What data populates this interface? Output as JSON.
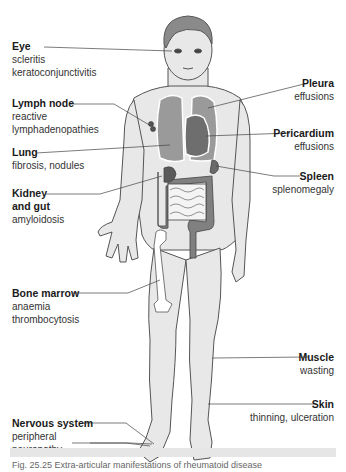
{
  "colors": {
    "skin": "#e8e8e8",
    "outline": "#555555",
    "hair": "#8a8a8a",
    "lung": "#9a9a9a",
    "heart": "#6e6e6e",
    "gut": "#808080",
    "kidney": "#5a5a5a",
    "leader_line": "#444444",
    "background": "#ffffff"
  },
  "labels": {
    "eye": {
      "title": "Eye",
      "details": [
        "scleritis",
        "keratoconjunctivitis"
      ]
    },
    "lymph_node": {
      "title": "Lymph node",
      "details": [
        "reactive",
        "lymphadenopathies"
      ]
    },
    "lung": {
      "title": "Lung",
      "details": [
        "fibrosis, nodules"
      ]
    },
    "kidney_gut": {
      "title_lines": [
        "Kidney",
        "and gut"
      ],
      "details": [
        "amyloidosis"
      ]
    },
    "bone_marrow": {
      "title": "Bone marrow",
      "details": [
        "anaemia",
        "thrombocytosis"
      ]
    },
    "nervous_system": {
      "title": "Nervous system",
      "details": [
        "peripheral",
        "neuropathy"
      ]
    },
    "pleura": {
      "title": "Pleura",
      "details": [
        "effusions"
      ]
    },
    "pericardium": {
      "title": "Pericardium",
      "details": [
        "effusions"
      ]
    },
    "spleen": {
      "title": "Spleen",
      "details": [
        "splenomegaly"
      ]
    },
    "muscle": {
      "title": "Muscle",
      "details": [
        "wasting"
      ]
    },
    "skin": {
      "title": "Skin",
      "details": [
        "thinning, ulceration"
      ]
    }
  },
  "caption": "Fig. 25.25  Extra-articular manifestations of rheumatoid disease"
}
